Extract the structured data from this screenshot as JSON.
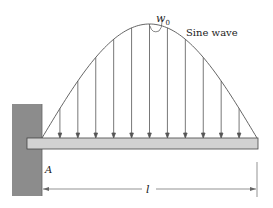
{
  "figure": {
    "labels": {
      "load_intensity": "w",
      "load_subscript": "0",
      "curve_label": "Sine wave",
      "support_label": "A",
      "length_label": "l"
    },
    "colors": {
      "wall": "#8c8c8c",
      "beam_fill": "#d2d2d2",
      "line": "#555555",
      "background": "#ffffff"
    },
    "load": {
      "type": "sinusoidal distributed load",
      "arrow_count": 11
    }
  }
}
